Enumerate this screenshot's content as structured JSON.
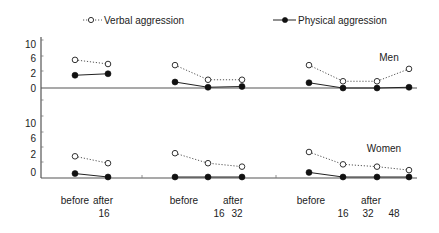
{
  "legend": {
    "verbal_label": "Verbal aggression",
    "physical_label": "Physical aggression"
  },
  "panels": {
    "men_label": "Men",
    "women_label": "Women"
  },
  "axis": {
    "y_tick_labels": [
      "0",
      "2",
      "6",
      "10"
    ],
    "x_row1": [
      "before",
      "after",
      "before",
      "after",
      "before",
      "after"
    ],
    "x_row2": [
      "16",
      "16",
      "32",
      "16",
      "32",
      "48"
    ]
  },
  "colors": {
    "ink": "#222222",
    "axis": "#555555",
    "background": "#ffffff"
  },
  "chart_data": {
    "type": "line",
    "title": "",
    "xlabel": "",
    "ylabel": "",
    "yticks": [
      0,
      2,
      6,
      10
    ],
    "grid": false,
    "legend_position": "top",
    "legend": [
      {
        "name": "Verbal aggression",
        "marker": "open-circle",
        "line": "dotted"
      },
      {
        "name": "Physical aggression",
        "marker": "filled-circle",
        "line": "solid"
      }
    ],
    "panels": [
      {
        "name": "Men",
        "groups": [
          {
            "x": [
              "before",
              "after 16"
            ],
            "series": [
              {
                "name": "Verbal aggression",
                "values": [
                  5.5,
                  4.4
                ]
              },
              {
                "name": "Physical aggression",
                "values": [
                  1.7,
                  1.9
                ]
              }
            ]
          },
          {
            "x": [
              "before",
              "after 16",
              "after 32"
            ],
            "series": [
              {
                "name": "Verbal aggression",
                "values": [
                  4.1,
                  1.1,
                  1.1
                ]
              },
              {
                "name": "Physical aggression",
                "values": [
                  0.8,
                  0.1,
                  0.2
                ]
              }
            ]
          },
          {
            "x": [
              "before",
              "after 16",
              "after 32",
              "after 48"
            ],
            "series": [
              {
                "name": "Verbal aggression",
                "values": [
                  4.1,
                  0.9,
                  0.9,
                  3.1
                ]
              },
              {
                "name": "Physical aggression",
                "values": [
                  0.7,
                  0.0,
                  0.0,
                  0.1
                ]
              }
            ]
          }
        ]
      },
      {
        "name": "Women",
        "groups": [
          {
            "x": [
              "before",
              "after 16"
            ],
            "series": [
              {
                "name": "Verbal aggression",
                "values": [
                  1.8,
                  1.2
                ]
              },
              {
                "name": "Physical aggression",
                "values": [
                  0.3,
                  0.0
                ]
              }
            ]
          },
          {
            "x": [
              "before",
              "after 16",
              "after 32"
            ],
            "series": [
              {
                "name": "Verbal aggression",
                "values": [
                  2.2,
                  1.2,
                  0.9
                ]
              },
              {
                "name": "Physical aggression",
                "values": [
                  0.0,
                  0.0,
                  0.0
                ]
              }
            ]
          },
          {
            "x": [
              "before",
              "after 16",
              "after 32",
              "after 48"
            ],
            "series": [
              {
                "name": "Verbal aggression",
                "values": [
                  2.5,
                  1.1,
                  0.9,
                  0.6
                ]
              },
              {
                "name": "Physical aggression",
                "values": [
                  0.4,
                  0.0,
                  0.0,
                  0.0
                ]
              }
            ]
          }
        ]
      }
    ]
  }
}
